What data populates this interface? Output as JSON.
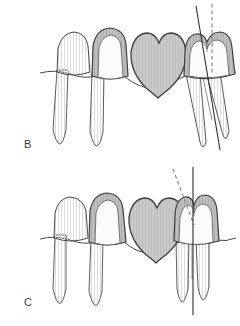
{
  "figure": {
    "background_color": "#ffffff",
    "width": 240,
    "height": 326
  },
  "colors": {
    "outline": "#3d3d3d",
    "outline_soft": "#6b6b6b",
    "enamel_fill": "#fdfdfd",
    "root_fill": "#f3f3f3",
    "crown_metal_fill": "#bdbdbd",
    "pontic_fill": "#c9c9c9",
    "hatch_stroke": "#d6d6d6",
    "reference_line": "#2f2f2f",
    "dashed_line": "#8a8a8a",
    "label_text": "#3a3a3a"
  },
  "panels": [
    {
      "id": "panel-b",
      "label": "B",
      "caption": "Mesially tilted molar abutment with bridge in place",
      "molar_state": "tilted",
      "molar_tilt_degrees": 14,
      "solid_line": {
        "name": "long-axis-line",
        "style": "solid",
        "orientation": "tilted",
        "meaning": "long axis of tilted molar"
      },
      "dashed_line": {
        "name": "vertical-reference-line",
        "style": "dashed",
        "orientation": "vertical",
        "meaning": "ideal vertical path of insertion"
      },
      "teeth": [
        {
          "name": "tooth-premolar-uncrowned",
          "position": "left",
          "crowned": false,
          "roots": 1,
          "fill": "enamel"
        },
        {
          "name": "tooth-premolar-abutment",
          "position": "left-center",
          "crowned": true,
          "roots": 1,
          "fill": "enamel-with-metal-crown"
        },
        {
          "name": "pontic",
          "position": "center",
          "crowned": true,
          "roots": 0,
          "fill": "pontic"
        },
        {
          "name": "tooth-molar-abutment",
          "position": "right",
          "crowned": true,
          "roots": 2,
          "fill": "enamel-with-metal-crown"
        }
      ]
    },
    {
      "id": "panel-c",
      "label": "C",
      "caption": "Uprighted molar abutment with bridge in place",
      "molar_state": "upright",
      "molar_tilt_degrees": 0,
      "solid_line": {
        "name": "long-axis-line",
        "style": "solid",
        "orientation": "vertical",
        "meaning": "long axis of uprighted molar"
      },
      "dashed_line": {
        "name": "former-tilt-reference-line",
        "style": "dashed",
        "orientation": "tilted",
        "meaning": "former tilted axis before uprighting"
      },
      "teeth": [
        {
          "name": "tooth-premolar-uncrowned",
          "position": "left",
          "crowned": false,
          "roots": 1,
          "fill": "enamel"
        },
        {
          "name": "tooth-premolar-abutment",
          "position": "left-center",
          "crowned": true,
          "roots": 1,
          "fill": "enamel-with-metal-crown"
        },
        {
          "name": "pontic",
          "position": "center",
          "crowned": true,
          "roots": 0,
          "fill": "pontic"
        },
        {
          "name": "tooth-molar-abutment",
          "position": "right",
          "crowned": true,
          "roots": 2,
          "fill": "enamel-with-metal-crown"
        }
      ]
    }
  ]
}
